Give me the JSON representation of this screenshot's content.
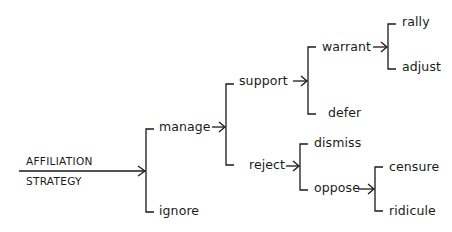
{
  "diagram": {
    "type": "bracket-tree",
    "root": {
      "line1": "AFFILIATION",
      "line2": "STRATEGY"
    },
    "nodes": {
      "manage": "manage",
      "ignore": "ignore",
      "support": "support",
      "reject": "reject",
      "warrant": "warrant",
      "defer": "defer",
      "rally": "rally",
      "adjust": "adjust",
      "dismiss": "dismiss",
      "oppose": "oppose",
      "censure": "censure",
      "ridicule": "ridicule"
    },
    "tree": {
      "label": "AFFILIATION STRATEGY",
      "children": [
        {
          "label": "manage",
          "children": [
            {
              "label": "support",
              "children": [
                {
                  "label": "warrant",
                  "children": [
                    {
                      "label": "rally"
                    },
                    {
                      "label": "adjust"
                    }
                  ]
                },
                {
                  "label": "defer"
                }
              ]
            },
            {
              "label": "reject",
              "children": [
                {
                  "label": "dismiss"
                },
                {
                  "label": "oppose",
                  "children": [
                    {
                      "label": "censure"
                    },
                    {
                      "label": "ridicule"
                    }
                  ]
                }
              ]
            }
          ]
        },
        {
          "label": "ignore"
        }
      ]
    },
    "colors": {
      "ink": "#1a1a1a",
      "background": "#ffffff"
    }
  }
}
